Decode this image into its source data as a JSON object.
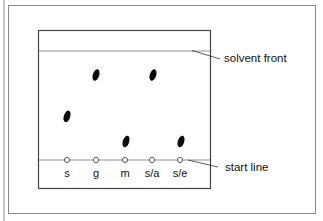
{
  "diagram": {
    "annotations": {
      "solvent_front": "solvent front",
      "start_line": "start line"
    },
    "lanes": [
      {
        "label": "s",
        "spot_rf": 0.4
      },
      {
        "label": "g",
        "spot_rf": 0.78
      },
      {
        "label": "m",
        "spot_rf": 0.17
      },
      {
        "label": "s/a",
        "spot_rf": 0.78
      },
      {
        "label": "s/e",
        "spot_rf": 0.17
      }
    ],
    "colors": {
      "line": "#555555",
      "spot": "#0a0a0a",
      "frame": "#777777"
    }
  }
}
